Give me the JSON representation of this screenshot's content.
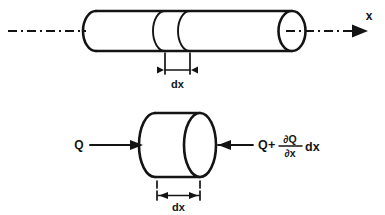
{
  "figure": {
    "name": "heat-conduction-control-volume",
    "background_color": "#ffffff",
    "line_color": "#141414"
  },
  "top_view": {
    "name": "rod-with-dx-slice",
    "axis_label": "x",
    "dimension_label": "dx",
    "centerline_style": "dash-dot"
  },
  "bottom_view": {
    "name": "control-volume-disk",
    "dimension_label": "dx",
    "inflow_label": "Q",
    "outflow": {
      "base": "Q",
      "plus": "+",
      "numerator": "∂Q",
      "denominator": "∂x",
      "trailing": "dx",
      "full_text": "Q + ∂Q/∂x dx"
    }
  }
}
